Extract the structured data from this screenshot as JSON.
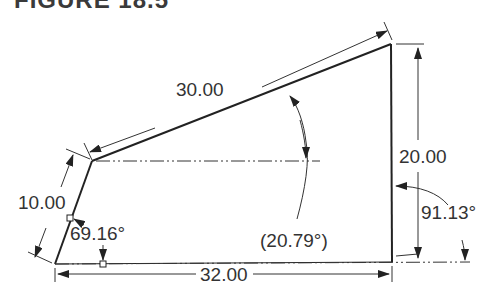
{
  "figure": {
    "title": "FIGURE 18.5"
  },
  "dimensions": {
    "slant_top": "30.00",
    "left_edge": "10.00",
    "right_edge": "20.00",
    "bottom": "32.00",
    "left_angle": "69.16°",
    "right_angle": "91.13°",
    "reference_angle": "(20.79°)"
  },
  "colors": {
    "line": "#222222",
    "text": "#333333",
    "background": "#ffffff"
  }
}
